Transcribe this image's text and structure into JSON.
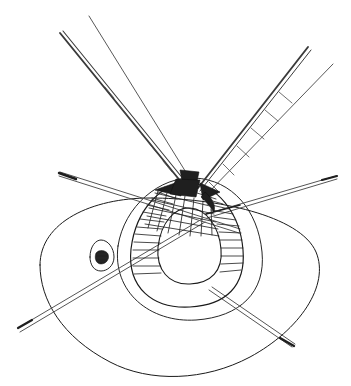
{
  "figure": {
    "title": "Technical line drawing of deployed spacecraft with ribbed conical body, truss booms and rod antennas",
    "style": "monochrome ink line drawing",
    "background_color": "#ffffff",
    "line_color": "#1a1a1a",
    "shadow_fill_color": "#1f1f1f",
    "canvas": {
      "width": 351,
      "height": 386
    }
  },
  "parts": {
    "base_outline": {
      "name": "outer base ellipse",
      "stroke_width": 1.0,
      "path": "M 40 265 C 40 222, 92 198, 150 198 C 215 198, 300 215, 316 252 C 330 285, 300 330, 250 357 C 205 381, 150 383, 110 362 C 62 337, 40 300, 40 265 Z"
    },
    "base_inner_rim": {
      "name": "base inner rim arc",
      "stroke_width": 0.95,
      "path": "M 118 246 C 124 206, 160 176, 195 178 C 232 180, 258 210, 262 252 C 266 292, 240 317, 196 320 C 150 323, 112 292, 118 246 Z"
    },
    "dome_outer": {
      "name": "ribbed dome outer silhouette",
      "stroke_width": 1.15,
      "path": "M 131 249 C 136 208, 163 182, 189 183 C 216 184, 240 212, 243 250 C 246 286, 226 305, 190 307 C 153 309, 127 288, 131 249 Z"
    },
    "dome_inner_void": {
      "name": "dome inner opening",
      "stroke_width": 1.1,
      "path": "M 158 247 C 161 222, 175 207, 190 208 C 206 209, 219 226, 221 249 C 223 271, 211 283, 190 284 C 169 285, 156 270, 158 247 Z"
    },
    "apex_mesh": {
      "name": "cross hatched apex mesh",
      "rib_count": 16,
      "cross_count": 6
    },
    "rib_hatching": {
      "name": "radial rib hatching on dome",
      "rib_count": 20
    },
    "booms": [
      {
        "id": "boom-upper-left",
        "name": "upper-left truss boom",
        "rail_a": {
          "x1": 183,
          "y1": 185,
          "x2": 60,
          "y2": 33
        },
        "rail_b": {
          "x1": 190,
          "y1": 183,
          "x2": 89,
          "y2": 16
        },
        "rung_count": 6,
        "stroke_width": 1.3
      },
      {
        "id": "boom-upper-right",
        "name": "upper-right truss boom",
        "rail_a": {
          "x1": 199,
          "y1": 185,
          "x2": 309,
          "y2": 47
        },
        "rail_b": {
          "x1": 205,
          "y1": 189,
          "x2": 333,
          "y2": 64
        },
        "rung_count": 6,
        "stroke_width": 1.3
      }
    ],
    "antennas": [
      {
        "id": "antenna-upper-left",
        "name": "upper-left rod antenna",
        "x1": 60,
        "y1": 172,
        "x2": 238,
        "y2": 228,
        "stroke_width": 1.0,
        "tip_at": "start"
      },
      {
        "id": "antenna-right",
        "name": "right rod antenna",
        "x1": 208,
        "y1": 212,
        "x2": 337,
        "y2": 176,
        "stroke_width": 1.0,
        "tip_at": "end"
      },
      {
        "id": "antenna-lower-left",
        "name": "lower-left rod antenna",
        "x1": 18,
        "y1": 327,
        "x2": 202,
        "y2": 218,
        "stroke_width": 1.0,
        "tip_at": "start"
      },
      {
        "id": "antenna-lower-right",
        "name": "lower-right rod antenna",
        "x1": 210,
        "y1": 292,
        "x2": 293,
        "y2": 348,
        "stroke_width": 1.0,
        "tip_at": "end"
      }
    ],
    "apex_wedges": [
      {
        "id": "wedge-left",
        "name": "left shaded apex wedge",
        "path": "M 155 190 L 178 182 L 181 196 Z"
      },
      {
        "id": "wedge-center",
        "name": "center shaded apex wedge",
        "path": "M 176 179 L 200 180 L 196 197 L 170 194 Z"
      },
      {
        "id": "wedge-right",
        "name": "right shaded apex wedge",
        "path": "M 200 183 L 220 192 L 203 200 Z"
      },
      {
        "id": "wedge-cap",
        "name": "apex cap shadow",
        "path": "M 180 170 L 199 172 L 197 181 L 182 180 Z"
      }
    ],
    "detail_marking": {
      "id": "hatch-detail-left",
      "name": "small teardrop inspection marking",
      "outline_path": "M 90 257 C 90 246, 96 240, 101 240 C 108 240, 114 248, 114 257 C 114 266, 107 271, 101 271 C 94 271, 90 265, 90 257 Z",
      "blob_path": "M 96 253 C 99 249, 106 250, 108 254 C 110 259, 106 264, 101 264 C 96 264, 94 258, 96 253 Z"
    }
  },
  "labels": {
    "figure_caption": "",
    "part_numbers": []
  }
}
